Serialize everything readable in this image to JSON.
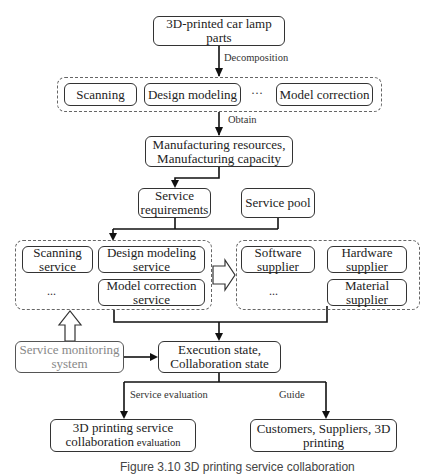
{
  "diagram": {
    "top_node": "3D-printed car lamp parts",
    "edge_decomposition": "Decomposition",
    "decomposition_group": {
      "items": [
        "Scanning",
        "Design modeling",
        "Model correction"
      ],
      "ellipsis": "···"
    },
    "edge_obtain": "Obtain",
    "manufacturing_node": {
      "line1": "Manufacturing resources,",
      "line2": "Manufacturing capacity"
    },
    "service_requirements": {
      "line1": "Service",
      "line2": "requirements"
    },
    "service_pool": "Service pool",
    "service_group": {
      "scanning_service": {
        "line1": "Scanning",
        "line2": "service"
      },
      "design_modeling_service": {
        "line1": "Design modeling",
        "line2": "service"
      },
      "model_correction_service": {
        "line1": "Model correction",
        "line2": "service"
      },
      "ellipsis": "..."
    },
    "supplier_group": {
      "software_supplier": {
        "line1": "Software",
        "line2": "supplier"
      },
      "hardware_supplier": {
        "line1": "Hardware",
        "line2": "supplier"
      },
      "material_supplier": {
        "line1": "Material",
        "line2": "supplier"
      },
      "ellipsis": "..."
    },
    "monitoring_node": {
      "line1": "Service monitoring",
      "line2": "system"
    },
    "execution_node": {
      "line1": "Execution state,",
      "line2": "Collaboration state"
    },
    "edge_service_evaluation": "Service evaluation",
    "edge_guide": "Guide",
    "evaluation_node": {
      "line1": "3D printing service",
      "line2a": "collaboration",
      "line2b": " evaluation"
    },
    "customers_node": {
      "line1": "Customers, Suppliers, 3D",
      "line2": "printing"
    }
  },
  "caption": "Figure 3.10 3D printing service collaboration"
}
